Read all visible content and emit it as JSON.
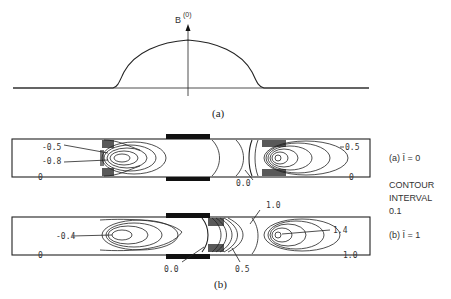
{
  "figure": {
    "panel_a": {
      "axis_label": "B",
      "axis_superscript": "(0)",
      "caption": "(a)"
    },
    "panel_b": {
      "caption": "(b)",
      "top_plot": {
        "labels": [
          "-0.5",
          "-0.8",
          "0",
          "0.0",
          "0.5",
          "0"
        ],
        "side_label": "(a) Ī = 0"
      },
      "bottom_plot": {
        "labels": [
          "-0.4",
          "0",
          "0.0",
          "0.5",
          "1.0",
          "1.4",
          "1.0"
        ],
        "side_label": "(b) Ī = 1"
      },
      "contour_interval": {
        "line1": "CONTOUR",
        "line2": "INTERVAL",
        "line3": "0.1"
      }
    }
  }
}
